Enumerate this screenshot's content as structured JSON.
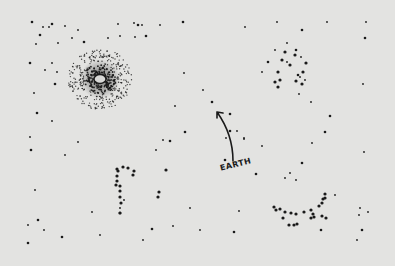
{
  "scene": {
    "title": "Star field sketch",
    "background_color": "#e3e3e1",
    "ink_color": "#1a1a1a",
    "label": {
      "text": "EARTH"
    },
    "arrow": {
      "from": [
        233,
        161
      ],
      "to": [
        217,
        112
      ]
    },
    "galaxy": {
      "cx": 100,
      "cy": 79,
      "radius": 32,
      "core_radius": 16
    },
    "stars": [
      [
        32,
        22
      ],
      [
        43,
        27
      ],
      [
        49,
        27
      ],
      [
        52,
        24
      ],
      [
        65,
        26
      ],
      [
        78,
        30
      ],
      [
        84,
        42
      ],
      [
        118,
        24
      ],
      [
        134,
        23
      ],
      [
        138,
        25
      ],
      [
        142,
        25
      ],
      [
        160,
        25
      ],
      [
        183,
        22
      ],
      [
        245,
        27
      ],
      [
        277,
        22
      ],
      [
        302,
        30
      ],
      [
        327,
        22
      ],
      [
        366,
        22
      ],
      [
        365,
        38
      ],
      [
        36,
        44
      ],
      [
        58,
        43
      ],
      [
        40,
        35
      ],
      [
        120,
        36
      ],
      [
        135,
        37
      ],
      [
        146,
        36
      ],
      [
        108,
        38
      ],
      [
        72,
        38
      ],
      [
        30,
        63
      ],
      [
        34,
        93
      ],
      [
        45,
        70
      ],
      [
        55,
        84
      ],
      [
        52,
        63
      ],
      [
        57,
        72
      ],
      [
        37,
        113
      ],
      [
        52,
        121
      ],
      [
        30,
        137
      ],
      [
        31,
        150
      ],
      [
        65,
        155
      ],
      [
        35,
        190
      ],
      [
        38,
        220
      ],
      [
        28,
        225
      ],
      [
        44,
        230
      ],
      [
        62,
        237
      ],
      [
        100,
        235
      ],
      [
        143,
        240
      ],
      [
        152,
        229
      ],
      [
        120,
        208
      ],
      [
        124,
        200
      ],
      [
        120,
        213
      ],
      [
        184,
        73
      ],
      [
        203,
        90
      ],
      [
        230,
        114
      ],
      [
        237,
        131
      ],
      [
        244,
        138
      ],
      [
        230,
        131
      ],
      [
        226,
        138
      ],
      [
        175,
        106
      ],
      [
        212,
        102
      ],
      [
        262,
        72
      ],
      [
        311,
        102
      ],
      [
        330,
        116
      ],
      [
        312,
        143
      ],
      [
        335,
        195
      ],
      [
        321,
        230
      ],
      [
        357,
        240
      ],
      [
        360,
        208
      ],
      [
        362,
        230
      ],
      [
        359,
        215
      ],
      [
        368,
        212
      ],
      [
        185,
        132
      ],
      [
        163,
        140
      ],
      [
        156,
        150
      ],
      [
        170,
        141
      ],
      [
        239,
        211
      ],
      [
        200,
        230
      ],
      [
        234,
        232
      ],
      [
        190,
        208
      ],
      [
        173,
        226
      ],
      [
        302,
        163
      ],
      [
        296,
        180
      ],
      [
        364,
        152
      ],
      [
        225,
        160
      ],
      [
        262,
        146
      ],
      [
        244,
        139
      ],
      [
        256,
        174
      ],
      [
        285,
        178
      ],
      [
        290,
        173
      ],
      [
        28,
        243
      ],
      [
        92,
        212
      ],
      [
        78,
        142
      ],
      [
        268,
        62
      ],
      [
        275,
        50
      ],
      [
        287,
        43
      ],
      [
        296,
        50
      ],
      [
        287,
        62
      ],
      [
        305,
        80
      ],
      [
        298,
        75
      ],
      [
        301,
        57
      ],
      [
        299,
        94
      ],
      [
        325,
        132
      ],
      [
        363,
        84
      ],
      [
        300,
        77
      ]
    ],
    "constellations": {
      "upper_right": [
        [
          285,
          52
        ],
        [
          295,
          55
        ],
        [
          282,
          60
        ],
        [
          306,
          63
        ],
        [
          290,
          65
        ],
        [
          278,
          72
        ],
        [
          303,
          72
        ],
        [
          280,
          80
        ],
        [
          296,
          81
        ],
        [
          275,
          82
        ],
        [
          302,
          84
        ],
        [
          278,
          87
        ]
      ],
      "question_mark": [
        [
          117,
          169
        ],
        [
          123,
          167
        ],
        [
          128,
          168
        ],
        [
          134,
          171
        ],
        [
          133,
          175
        ],
        [
          118,
          171
        ],
        [
          117,
          176
        ],
        [
          117,
          181
        ],
        [
          120,
          186
        ],
        [
          116,
          185
        ],
        [
          120,
          191
        ],
        [
          120,
          197
        ],
        [
          121,
          203
        ],
        [
          120,
          213
        ],
        [
          159,
          192
        ],
        [
          158,
          197
        ],
        [
          166,
          170
        ]
      ],
      "arc_lower_right": [
        [
          274,
          207
        ],
        [
          276,
          210
        ],
        [
          280,
          209
        ],
        [
          285,
          212
        ],
        [
          291,
          213
        ],
        [
          296,
          214
        ],
        [
          304,
          212
        ],
        [
          311,
          210
        ],
        [
          313,
          214
        ],
        [
          319,
          206
        ],
        [
          322,
          203
        ],
        [
          323,
          199
        ],
        [
          325,
          194
        ],
        [
          325,
          198
        ],
        [
          283,
          218
        ],
        [
          289,
          225
        ],
        [
          294,
          225
        ],
        [
          297,
          224
        ],
        [
          311,
          218
        ],
        [
          314,
          217
        ],
        [
          322,
          216
        ],
        [
          326,
          218
        ]
      ]
    }
  }
}
